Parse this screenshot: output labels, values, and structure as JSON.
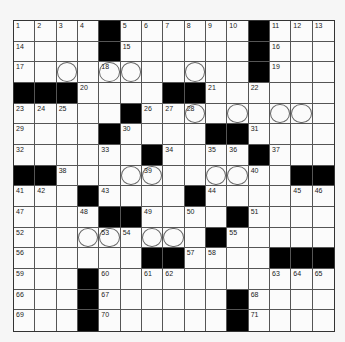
{
  "puzzle": {
    "rows": 15,
    "cols": 15,
    "colors": {
      "black": "#000000",
      "cell": "#fbfbfb",
      "background": "#f6f6f6",
      "line": "#555555"
    },
    "grid": [
      [
        "1",
        "2",
        "3",
        "4",
        "#",
        "5",
        "6",
        "7",
        "8",
        "9",
        "10",
        "#",
        "11",
        "12",
        "13"
      ],
      [
        "14",
        ".",
        ".",
        ".",
        "#",
        "15",
        ".",
        ".",
        ".",
        ".",
        ".",
        "#",
        "16",
        ".",
        "."
      ],
      [
        "17",
        ".",
        "o",
        ".",
        "18o",
        "o",
        ".",
        ".",
        "o",
        ".",
        ".",
        "#",
        "19",
        ".",
        "."
      ],
      [
        "#",
        "#",
        "#",
        "20",
        ".",
        ".",
        ".",
        "#",
        "#",
        "21",
        ".",
        "22",
        ".",
        ".",
        "."
      ],
      [
        "23",
        "24",
        "25",
        ".",
        ".",
        "#",
        "26",
        "27",
        "28o",
        ".",
        "o",
        ".",
        "o",
        "o",
        "."
      ],
      [
        "29",
        ".",
        ".",
        ".",
        "#",
        "30",
        ".",
        ".",
        ".",
        "#",
        "#",
        "31",
        ".",
        ".",
        "."
      ],
      [
        "32",
        ".",
        ".",
        ".",
        "33",
        ".",
        "#",
        "34",
        ".",
        "35",
        "36",
        "#",
        "37",
        ".",
        "."
      ],
      [
        "#",
        "#",
        "38",
        ".",
        ".",
        "o",
        "39o",
        ".",
        ".",
        "o",
        "o",
        "40",
        ".",
        "#",
        "#"
      ],
      [
        "41",
        "42",
        ".",
        "#",
        "43",
        ".",
        ".",
        ".",
        "#",
        "44",
        ".",
        ".",
        ".",
        "45",
        "46"
      ],
      [
        "47",
        ".",
        ".",
        "48",
        "#",
        "#",
        "49",
        ".",
        "50",
        ".",
        "#",
        "51",
        ".",
        ".",
        "."
      ],
      [
        "52",
        ".",
        ".",
        "o",
        "53o",
        "54",
        "o",
        "o",
        ".",
        "#",
        "55",
        ".",
        ".",
        ".",
        "."
      ],
      [
        "56",
        ".",
        ".",
        ".",
        ".",
        ".",
        "#",
        "#",
        "57",
        "58",
        ".",
        ".",
        "#",
        "#",
        "#"
      ],
      [
        "59",
        ".",
        ".",
        "#",
        "60",
        ".",
        "61",
        "62",
        ".",
        ".",
        ".",
        ".",
        "63",
        "64",
        "65"
      ],
      [
        "66",
        ".",
        ".",
        "#",
        "67",
        ".",
        ".",
        ".",
        ".",
        ".",
        "#",
        "68",
        ".",
        ".",
        "."
      ],
      [
        "69",
        ".",
        ".",
        "#",
        "70",
        ".",
        ".",
        ".",
        ".",
        ".",
        "#",
        "71",
        ".",
        ".",
        "."
      ]
    ],
    "legend": {
      "#": "black-square",
      ".": "empty-square",
      "o": "circled-square",
      "Nn": "numbered-square",
      "No": "numbered-circled-square"
    }
  }
}
